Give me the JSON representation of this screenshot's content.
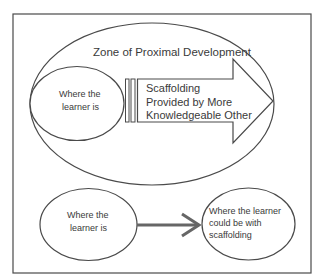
{
  "diagram": {
    "title": "Zone of Proximal Development",
    "top_panel": {
      "outer_zone_label": "Zone of Proximal Development",
      "inner_ellipse": {
        "line1": "Where the",
        "line2": "learner is"
      },
      "scaffold_arrow": {
        "line1": "Scaffolding",
        "line2": "Provided by More",
        "line3": "Knowledgeable Other"
      }
    },
    "bottom_panel": {
      "left_ellipse": {
        "line1": "Where the",
        "line2": "learner is"
      },
      "right_ellipse": {
        "line1": "Where the learner",
        "line2": "could be with",
        "line3": "scaffolding"
      },
      "connector": "arrow-right"
    },
    "colors": {
      "stroke": "#4a4a4a",
      "text": "#3a3a3a",
      "arrow_line": "#666666",
      "background": "#ffffff"
    }
  }
}
